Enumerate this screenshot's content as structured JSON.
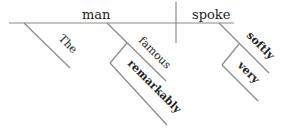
{
  "diagram": {
    "type": "sentence-diagram",
    "sentence_words": [
      "The",
      "famous",
      "remarkably",
      "man",
      "spoke",
      "very",
      "softly"
    ],
    "subject": "man",
    "predicate": "spoke",
    "modifiers": {
      "the": "The",
      "famous": "famous",
      "remarkably": "remarkably",
      "softly": "softly",
      "very": "very"
    },
    "colors": {
      "line": "#8a8a8a",
      "text": "#222222"
    }
  }
}
